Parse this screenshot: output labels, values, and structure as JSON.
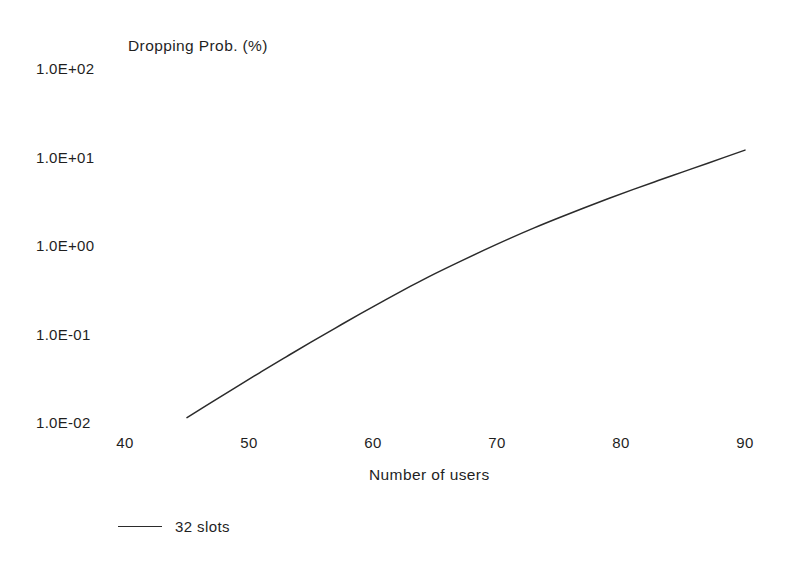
{
  "chart_data": {
    "type": "line",
    "title": "Dropping Prob. (%)",
    "xlabel": "Number of users",
    "ylabel": "Dropping Prob. (%)",
    "yscale": "log",
    "xscale": "linear",
    "xlim": [
      40,
      90
    ],
    "ylim": [
      0.01,
      100
    ],
    "grid": false,
    "legend_position": "below-left",
    "xticks": [
      "40",
      "50",
      "60",
      "70",
      "80",
      "90"
    ],
    "xtick_values": [
      40,
      50,
      60,
      70,
      80,
      90
    ],
    "yticks": [
      "1.0E-02",
      "1.0E-01",
      "1.0E+00",
      "1.0E+01",
      "1.0E+02"
    ],
    "ytick_values": [
      0.01,
      0.1,
      1,
      10,
      100
    ],
    "series": [
      {
        "name": "32 slots",
        "color": "#2b2b2b",
        "x": [
          45.0,
          47.0,
          49.0,
          51.0,
          53.0,
          55.0,
          57.0,
          59.0,
          61.0,
          63.0,
          65.0,
          67.0,
          69.0,
          71.0,
          73.0,
          75.0,
          77.0,
          79.0,
          81.0,
          83.0,
          85.0,
          87.0,
          90.0
        ],
        "y": [
          0.0112,
          0.0168,
          0.025,
          0.037,
          0.0545,
          0.08,
          0.116,
          0.168,
          0.24,
          0.34,
          0.475,
          0.65,
          0.88,
          1.18,
          1.56,
          2.03,
          2.62,
          3.35,
          4.25,
          5.35,
          6.7,
          8.4,
          11.8
        ]
      }
    ]
  },
  "legend": {
    "items": [
      {
        "label": "32 slots"
      }
    ]
  }
}
